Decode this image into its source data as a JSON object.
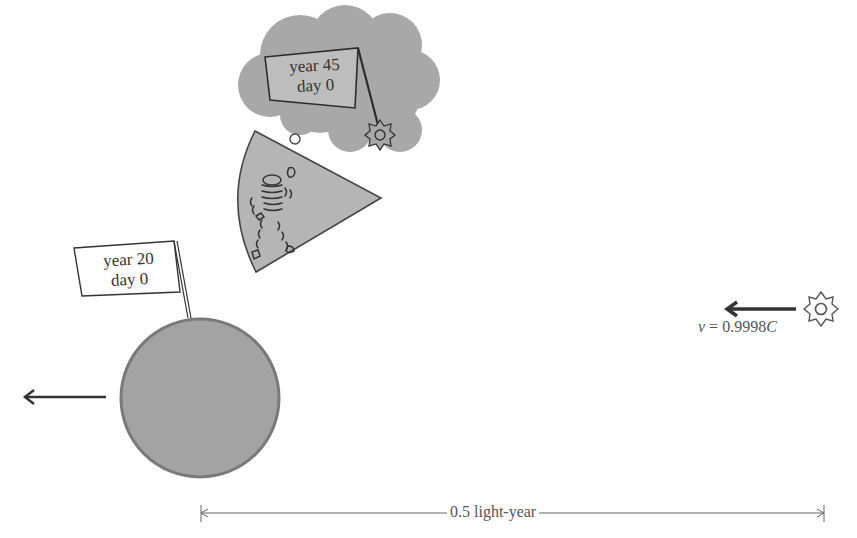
{
  "diagram": {
    "type": "relativity-twin-illustration",
    "thought_flag": {
      "line1": "year 45",
      "line2": "day 0"
    },
    "planet_flag": {
      "line1": "year 20",
      "line2": "day 0"
    },
    "velocity": {
      "symbol": "v",
      "eq": "=",
      "value": "0.9998",
      "unit": "C"
    },
    "distance": {
      "label": "0.5 light-year"
    },
    "colors": {
      "cloud": "#a8a8a8",
      "planet_fill": "#a3a3a3",
      "planet_stroke": "#7a7a7a",
      "ink": "#333333",
      "sector_fill": "#b5b5b5"
    }
  }
}
